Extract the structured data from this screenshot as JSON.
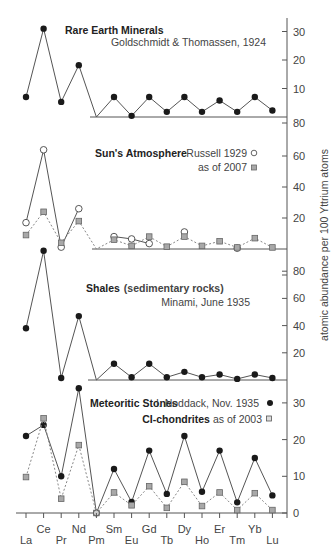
{
  "chart_data": {
    "type": "line",
    "layout": "four vertically stacked panels sharing an x-axis (lanthanides) and a right-side y-axis",
    "ylabel": "atomic abundance per 100 Yttrium atoms",
    "categories": [
      "La",
      "Ce",
      "Pr",
      "Nd",
      "Pm",
      "Sm",
      "Eu",
      "Gd",
      "Tb",
      "Dy",
      "Ho",
      "Er",
      "Tm",
      "Yb",
      "Lu"
    ],
    "x_label_rows": {
      "upper": [
        "Ce",
        "Nd",
        "Sm",
        "Gd",
        "Dy",
        "Er",
        "Yb"
      ],
      "lower": [
        "La",
        "Pr",
        "Pm",
        "Eu",
        "Tb",
        "Ho",
        "Tm",
        "Lu"
      ]
    },
    "grid": false,
    "panels": [
      {
        "id": "minerals",
        "title_bold": "Rare Earth Minerals",
        "title_regular": "",
        "subtitle": "Goldschmidt & Thomassen, 1924",
        "ylim": [
          0,
          35
        ],
        "yticks": [
          10,
          20,
          30
        ],
        "series": [
          {
            "name": "Goldschmidt & Thomassen, 1924",
            "marker": "filled-circle",
            "line": "solid",
            "values": [
              7,
              31,
              5.3,
              18.2,
              0,
              7,
              0.4,
              7,
              1.8,
              7,
              1.8,
              5.8,
              1.8,
              7,
              2.3
            ]
          }
        ]
      },
      {
        "id": "sun",
        "title_bold": "Sun's Atmosphere",
        "title_regular": "",
        "legend": [
          {
            "label": "Russell 1929",
            "marker": "open-circle"
          },
          {
            "label": "as of 2007",
            "marker": "gray-square"
          }
        ],
        "ylim": [
          0,
          70
        ],
        "yticks": [
          20,
          40,
          60
        ],
        "series": [
          {
            "name": "Russell 1929",
            "marker": "open-circle",
            "line": "solid",
            "values": [
              17,
              64,
              1.2,
              26,
              null,
              8,
              6.5,
              3.5,
              null,
              11,
              null,
              null,
              0.5,
              null,
              null
            ],
            "segments": [
              [
                0,
                3
              ],
              [
                5,
                7
              ]
            ]
          },
          {
            "name": "as of 2007",
            "marker": "gray-square",
            "line": "dotted",
            "values": [
              9,
              24,
              4,
              18,
              0,
              6,
              2,
              8,
              1.5,
              8,
              2,
              5,
              1,
              7,
              1
            ]
          }
        ]
      },
      {
        "id": "shales",
        "title_bold": "Shales",
        "title_regular": " (sedimentary rocks)",
        "subtitle": "Minami, June 1935",
        "ylim": [
          0,
          100
        ],
        "yticks": [
          20,
          40,
          60,
          80
        ],
        "series": [
          {
            "name": "Minami, June 1935",
            "marker": "filled-circle",
            "line": "solid",
            "values": [
              38,
              95,
              1.5,
              47,
              0,
              12,
              2,
              12,
              2,
              6,
              2,
              4,
              0.8,
              4,
              1.5
            ]
          }
        ]
      },
      {
        "id": "meteoritic",
        "title_bold": "Meteoritic Stones",
        "title_regular": "",
        "legend": [
          {
            "label_bold": "Meteoritic Stones",
            "label": "I. Noddack, Nov. 1935",
            "marker": "filled-circle"
          },
          {
            "label_bold": "CI-chondrites",
            "label": "as of 2003",
            "marker": "gray-square"
          }
        ],
        "ylim": [
          0,
          35
        ],
        "yticks": [
          0,
          10,
          20,
          30
        ],
        "series": [
          {
            "name": "I. Noddack, Nov. 1935",
            "marker": "filled-circle",
            "line": "solid",
            "values": [
              21,
              24,
              10,
              34,
              0,
              12,
              3,
              17,
              5.2,
              21,
              5.8,
              17,
              2.9,
              15,
              4.8
            ]
          },
          {
            "name": "CI-chondrites as of 2003",
            "marker": "gray-square",
            "line": "dotted",
            "values": [
              9.8,
              25.8,
              3.9,
              18.5,
              0,
              5.6,
              2.1,
              7.3,
              1.4,
              8.5,
              1.9,
              5.6,
              0.8,
              5.4,
              0.8
            ]
          }
        ]
      }
    ]
  },
  "labels": {
    "minerals_title": "Rare Earth Minerals",
    "minerals_source": "Goldschmidt & Thomassen, 1924",
    "sun_title": "Sun's Atmosphere",
    "sun_legend_1": "Russell 1929",
    "sun_legend_2": "as of 2007",
    "shales_title": "Shales",
    "shales_title_rest": "(sedimentary rocks)",
    "shales_source": "Minami, June 1935",
    "met_title": "Meteoritic Stones",
    "met_source": "I. Noddack, Nov. 1935",
    "ci_title": "CI-chondrites",
    "ci_source": "as of 2003",
    "y_axis_title": "atomic abundance per 100 Yttrium atoms"
  },
  "colors": {
    "line": "#555555",
    "dot": "#1a1a1a",
    "square_fill": "#a8a8a8",
    "square_stroke": "#666666",
    "axis": "#555555"
  }
}
